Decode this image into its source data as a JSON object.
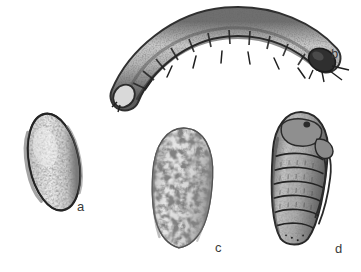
{
  "plate": {
    "title": "Insect life stages illustration plate",
    "background_color": "#ffffff",
    "width": 361,
    "height": 272,
    "medium": "grayscale stipple and line engraving",
    "ink_color": "#3a3a3a"
  },
  "figures": [
    {
      "id": "a",
      "label": "a",
      "name": "egg",
      "description": "Oval egg, tilted, dark outline with speckled pale interior",
      "bounds": {
        "x": 28,
        "y": 112,
        "width": 52,
        "height": 101
      },
      "fill_color": "#e4e4e4",
      "outline_color": "#2e2e2e"
    },
    {
      "id": "b",
      "label": "b",
      "name": "larva",
      "description": "Curved segmented larva arcing from tail at lower left to darker head at right, with bristles",
      "bounds": {
        "x": 115,
        "y": 14,
        "width": 225,
        "height": 90
      },
      "fill_color": "#9a9a9a",
      "outline_color": "#2a2a2a",
      "segment_count": 12
    },
    {
      "id": "c",
      "label": "c",
      "name": "cocoon",
      "description": "Vertical rounded cocoon with rough granular mottled texture",
      "bounds": {
        "x": 152,
        "y": 127,
        "width": 61,
        "height": 122
      },
      "fill_color": "#dcdcdc",
      "outline_color": "#4a4a4a"
    },
    {
      "id": "d",
      "label": "d",
      "name": "pupa",
      "description": "Elongated vertical pupa with banded abdominal segments and appendage cases along right side",
      "bounds": {
        "x": 271,
        "y": 112,
        "width": 56,
        "height": 134
      },
      "fill_color": "#b0b0b0",
      "outline_color": "#2a2a2a",
      "segment_count": 8
    }
  ]
}
